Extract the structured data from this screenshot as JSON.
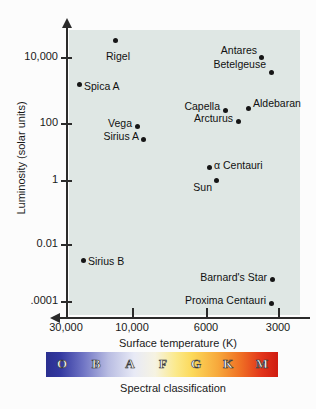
{
  "chart_data": {
    "type": "scatter",
    "title": "",
    "xlabel": "Surface temperature (K)",
    "ylabel": "Luminosity (solar units)",
    "xticks": [
      "30,000",
      "10,000",
      "6000",
      "3000"
    ],
    "yticks": [
      "10,000",
      "100",
      "1",
      "0.01",
      ".0001"
    ],
    "xaxis_direction": "decreasing",
    "yaxis_scale": "log",
    "grid": false,
    "legend": "none",
    "plot_background": "#dfe7e4",
    "point_color": "#161616",
    "points": [
      {
        "name": "Rigel",
        "temperature_k": 12000,
        "luminosity_solar": 120000,
        "label_pos": "below"
      },
      {
        "name": "Spica A",
        "temperature_k": 22400,
        "luminosity_solar": 20000,
        "label_pos": "right"
      },
      {
        "name": "Antares",
        "temperature_k": 3400,
        "luminosity_solar": 38000,
        "label_pos": "left"
      },
      {
        "name": "Betelgeuse",
        "temperature_k": 3100,
        "luminosity_solar": 14000,
        "label_pos": "left"
      },
      {
        "name": "Capella",
        "temperature_k": 5000,
        "luminosity_solar": 160,
        "label_pos": "left"
      },
      {
        "name": "Aldebaran",
        "temperature_k": 4000,
        "luminosity_solar": 170,
        "label_pos": "right"
      },
      {
        "name": "Arcturus",
        "temperature_k": 4300,
        "luminosity_solar": 110,
        "label_pos": "left"
      },
      {
        "name": "Vega",
        "temperature_k": 9600,
        "luminosity_solar": 60,
        "label_pos": "left"
      },
      {
        "name": "Sirius A",
        "temperature_k": 9200,
        "luminosity_solar": 26,
        "label_pos": "left"
      },
      {
        "name": "α Centauri",
        "temperature_k": 5800,
        "luminosity_solar": 2.5,
        "label_pos": "right"
      },
      {
        "name": "Sun",
        "temperature_k": 5500,
        "luminosity_solar": 1.0,
        "label_pos": "left"
      },
      {
        "name": "Sirius B",
        "temperature_k": 24000,
        "luminosity_solar": 0.0025,
        "label_pos": "right"
      },
      {
        "name": "Barnard's Star",
        "temperature_k": 3100,
        "luminosity_solar": 0.0005,
        "label_pos": "left"
      },
      {
        "name": "Proxima Centauri",
        "temperature_k": 3100,
        "luminosity_solar": 5e-05,
        "label_pos": "left"
      }
    ],
    "spectral_classification": {
      "caption": "Spectral classification",
      "classes": [
        "O",
        "B",
        "A",
        "F",
        "G",
        "K",
        "M"
      ],
      "colors": [
        "#2a2f8f",
        "#6f74c4",
        "#cdd1ec",
        "#f0eee0",
        "#fbe27a",
        "#f6a03a",
        "#d8281a"
      ]
    }
  },
  "geometry": {
    "points_px": [
      {
        "x": 115,
        "y": 40,
        "lx": 118,
        "ly": 50
      },
      {
        "x": 79,
        "y": 84,
        "lx": 84,
        "ly": 86
      },
      {
        "x": 261,
        "y": 57,
        "lx": 257,
        "ly": 50
      },
      {
        "x": 271,
        "y": 72,
        "lx": 266,
        "ly": 64
      },
      {
        "x": 225,
        "y": 110,
        "lx": 220,
        "ly": 106
      },
      {
        "x": 248,
        "y": 108,
        "lx": 253,
        "ly": 103
      },
      {
        "x": 238,
        "y": 121,
        "lx": 233,
        "ly": 118
      },
      {
        "x": 137,
        "y": 126,
        "lx": 132,
        "ly": 123
      },
      {
        "x": 143,
        "y": 139,
        "lx": 139,
        "ly": 136
      },
      {
        "x": 209,
        "y": 167,
        "lx": 214,
        "ly": 165
      },
      {
        "x": 216,
        "y": 180,
        "lx": 212,
        "ly": 187
      },
      {
        "x": 83,
        "y": 260,
        "lx": 88,
        "ly": 261
      },
      {
        "x": 272,
        "y": 279,
        "lx": 267,
        "ly": 277
      },
      {
        "x": 271,
        "y": 303,
        "lx": 266,
        "ly": 300
      }
    ],
    "yticks_px": [
      57,
      123,
      180,
      244,
      301
    ],
    "xticks_px": [
      66,
      132,
      206,
      278
    ],
    "spectral_letters_px": [
      62,
      96,
      130,
      163,
      196,
      228,
      262
    ]
  }
}
